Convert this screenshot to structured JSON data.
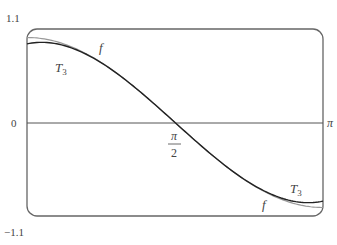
{
  "chart_data": {
    "type": "line",
    "title": "",
    "xlabel": "",
    "ylabel": "",
    "xlim": [
      0,
      3.14159
    ],
    "ylim": [
      -1.1,
      1.1
    ],
    "grid": false,
    "y_tick_labels": {
      "top": "1.1",
      "zero": "0",
      "bottom": "−1.1"
    },
    "x_tick_labels": {
      "mid_num": "π",
      "mid_den": "2",
      "end": "π"
    },
    "series": [
      {
        "name": "f",
        "function": "cos(x)",
        "color": "#999999"
      },
      {
        "name": "T3",
        "function": "-(x-π/2) + (x-π/2)^3/6",
        "color": "#222222"
      }
    ],
    "annotations": [
      {
        "text": "f",
        "near": "top-left curve"
      },
      {
        "text": "T",
        "sub": "3",
        "near": "top-left curve"
      },
      {
        "text": "T",
        "sub": "3",
        "near": "bottom-right curve"
      },
      {
        "text": "f",
        "near": "bottom-right curve"
      }
    ]
  }
}
